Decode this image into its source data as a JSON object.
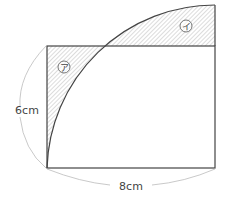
{
  "diagram": {
    "labels": {
      "height": "6cm",
      "width": "8cm",
      "region_a": "ア",
      "region_b": "イ"
    },
    "colors": {
      "line": "#444444",
      "hatch": "#9a9a9a",
      "dimension": "#aaaaaa"
    }
  }
}
